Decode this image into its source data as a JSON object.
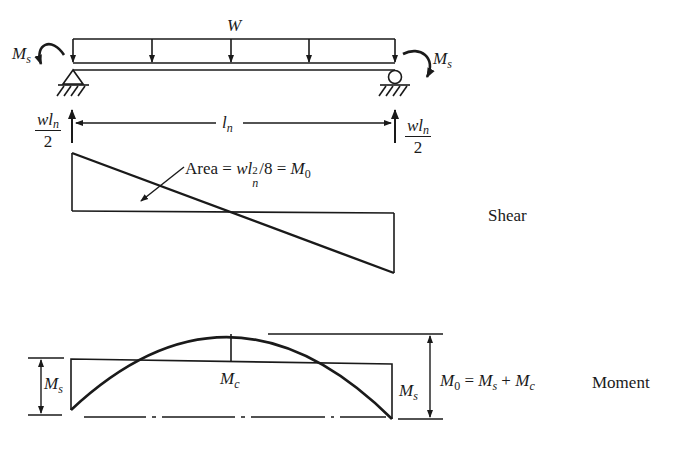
{
  "beam": {
    "load_label": "W",
    "left_moment": {
      "symbol": "M",
      "sub": "s"
    },
    "right_moment": {
      "symbol": "M",
      "sub": "s"
    },
    "span_label": {
      "symbol": "l",
      "sub": "n"
    },
    "left_reaction": {
      "num": "wl",
      "num_sub": "n",
      "den": "2"
    },
    "right_reaction": {
      "num": "wl",
      "num_sub": "n",
      "den": "2"
    }
  },
  "shear_diagram": {
    "title": "Shear",
    "area_note": {
      "prefix": "Area = ",
      "w": "wl",
      "exp": "2",
      "sub": "n",
      "mid": "/8 = ",
      "m": "M",
      "m_sub": "0"
    }
  },
  "moment_diagram": {
    "title": "Moment",
    "left_ms": {
      "symbol": "M",
      "sub": "s"
    },
    "right_ms": {
      "symbol": "M",
      "sub": "s"
    },
    "mc": {
      "symbol": "M",
      "sub": "c"
    },
    "equation": {
      "m0": "M",
      "m0_sub": "0",
      "eq": " = ",
      "ms": "M",
      "ms_sub": "s",
      "plus": " + ",
      "mc": "M",
      "mc_sub": "c"
    }
  },
  "colors": {
    "ink": "#1a1a1a",
    "background": "#ffffff"
  }
}
